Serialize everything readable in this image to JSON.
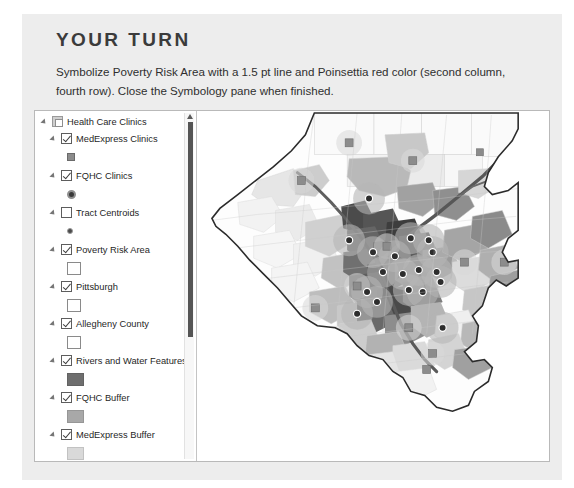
{
  "heading": "YOUR TURN",
  "instructions": "Symbolize Poverty Risk Area with a 1.5 pt line and Poinsettia red color (second column, fourth row). Close the Symbology pane when finished.",
  "colors": {
    "page_background": "#ffffff",
    "card_background": "#ededed",
    "heading_text": "#3b3b3b",
    "body_text": "#2f2f2f",
    "pane_background": "#ffffff",
    "pane_border": "#b9b9b9",
    "scrollbar_thumb": "#555555",
    "swatch_rivers": "#6e6e6e",
    "swatch_fqhc_buffer": "#a8a8a8",
    "swatch_medexpress_buffer": "#d9d9d9",
    "swatch_point_gray": "#8c8c8c",
    "swatch_point_dark": "#3a3a3a",
    "map_outline": "#2b2b2b"
  },
  "contents_pane": {
    "name": "Contents",
    "scrollbar": {
      "up_arrow_icon": "chevron-up-icon",
      "thumb_position_percent": 3,
      "thumb_size_percent": 62
    },
    "layers": [
      {
        "label": "Health Care Clinics",
        "type": "group",
        "indent": 0,
        "expander_icon": "expander-open-icon",
        "checkbox_state": "group-disabled",
        "swatch": null
      },
      {
        "label": "MedExpress Clinics",
        "type": "point",
        "indent": 1,
        "expander_icon": "expander-open-icon",
        "checkbox_state": "checked",
        "swatch": "square-fill"
      },
      {
        "label": "FQHC Clinics",
        "type": "point",
        "indent": 1,
        "expander_icon": "expander-open-icon",
        "checkbox_state": "checked",
        "swatch": "circle-ring"
      },
      {
        "label": "Tract Centroids",
        "type": "point",
        "indent": 1,
        "expander_icon": "expander-open-icon",
        "checkbox_state": "unchecked",
        "swatch": "dot"
      },
      {
        "label": "Poverty Risk Area",
        "type": "polygon",
        "indent": 1,
        "expander_icon": "expander-open-icon",
        "checkbox_state": "checked",
        "swatch": "hollow"
      },
      {
        "label": "Pittsburgh",
        "type": "polygon",
        "indent": 1,
        "expander_icon": "expander-open-icon",
        "checkbox_state": "checked",
        "swatch": "hollow"
      },
      {
        "label": "Allegheny County",
        "type": "polygon",
        "indent": 1,
        "expander_icon": "expander-open-icon",
        "checkbox_state": "checked",
        "swatch": "hollow"
      },
      {
        "label": "Rivers and Water Features",
        "type": "polygon",
        "indent": 1,
        "expander_icon": "expander-open-icon",
        "checkbox_state": "checked",
        "swatch": "fill-dark"
      },
      {
        "label": "FQHC Buffer",
        "type": "polygon",
        "indent": 1,
        "expander_icon": "expander-open-icon",
        "checkbox_state": "checked",
        "swatch": "fill-medium"
      },
      {
        "label": "MedExpress Buffer",
        "type": "polygon",
        "indent": 1,
        "expander_icon": "expander-open-icon",
        "checkbox_state": "checked",
        "swatch": "fill-light"
      }
    ]
  },
  "map": {
    "name": "allegheny-county-map",
    "description": "Grayscale choropleth of Allegheny County census tracts with clinic point symbols and buffer rings"
  }
}
